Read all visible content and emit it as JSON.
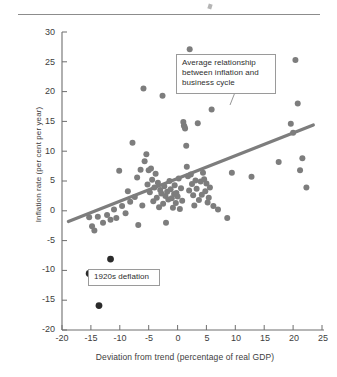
{
  "figure": {
    "y_axis_title": "Inflation rate (per cent per year)",
    "x_axis_title": "Deviation from trend (percentage of real GDP)",
    "annotations": {
      "trend": "Average relationship between inflation and business cycle",
      "deflation": "1920s deflation"
    }
  },
  "chart_data": {
    "type": "scatter",
    "title": "",
    "xlabel": "Deviation from trend (percentage of real GDP)",
    "ylabel": "Inflation rate (per cent per year)",
    "xlim": [
      -20,
      25
    ],
    "ylim": [
      -20,
      30
    ],
    "xticks": [
      -20,
      -15,
      -10,
      -5,
      0,
      5,
      10,
      15,
      20,
      25
    ],
    "yticks": [
      -20,
      -15,
      -10,
      -5,
      0,
      5,
      10,
      15,
      20,
      25,
      30
    ],
    "grid": false,
    "legend": "none",
    "point_color": "#7d7d7d",
    "highlight_color": "#2b2b2b",
    "trendline_color": "#7d7d7d",
    "series": [
      {
        "name": "Inflation vs business cycle",
        "color": "#7d7d7d",
        "points": [
          [
            -15.3,
            -1.1
          ],
          [
            -14.8,
            -2.6
          ],
          [
            -14.4,
            -3.3
          ],
          [
            -13.8,
            -1.0
          ],
          [
            -12.9,
            -2.0
          ],
          [
            -12.2,
            -0.7
          ],
          [
            -11.6,
            -1.5
          ],
          [
            -11.0,
            0.2
          ],
          [
            -10.6,
            -1.2
          ],
          [
            -10.1,
            6.7
          ],
          [
            -9.6,
            0.8
          ],
          [
            -9.0,
            -0.4
          ],
          [
            -8.6,
            3.3
          ],
          [
            -8.2,
            1.5
          ],
          [
            -7.8,
            11.4
          ],
          [
            -7.4,
            2.3
          ],
          [
            -7.0,
            5.6
          ],
          [
            -6.8,
            -2.4
          ],
          [
            -6.4,
            6.9
          ],
          [
            -6.1,
            0.9
          ],
          [
            -5.9,
            20.5
          ],
          [
            -5.7,
            8.3
          ],
          [
            -5.4,
            9.5
          ],
          [
            -5.2,
            4.4
          ],
          [
            -5.0,
            6.8
          ],
          [
            -4.8,
            3.1
          ],
          [
            -4.6,
            7.1
          ],
          [
            -4.4,
            5.2
          ],
          [
            -4.2,
            1.6
          ],
          [
            -4.0,
            3.9
          ],
          [
            -3.8,
            6.2
          ],
          [
            -3.6,
            2.2
          ],
          [
            -3.4,
            4.7
          ],
          [
            -3.2,
            0.6
          ],
          [
            -3.0,
            3.5
          ],
          [
            -2.8,
            2.9
          ],
          [
            -2.6,
            19.3
          ],
          [
            -2.5,
            1.2
          ],
          [
            -2.3,
            4.1
          ],
          [
            -2.1,
            2.5
          ],
          [
            -2.0,
            -2.0
          ],
          [
            -1.8,
            3.2
          ],
          [
            -1.6,
            1.9
          ],
          [
            -1.4,
            5.0
          ],
          [
            -1.2,
            3.6
          ],
          [
            -1.0,
            2.1
          ],
          [
            -0.8,
            0.5
          ],
          [
            -0.6,
            2.8
          ],
          [
            -0.5,
            4.3
          ],
          [
            -0.3,
            1.3
          ],
          [
            -0.2,
            3.0
          ],
          [
            0.0,
            2.4
          ],
          [
            0.2,
            5.4
          ],
          [
            0.4,
            0.3
          ],
          [
            0.6,
            3.8
          ],
          [
            0.8,
            1.7
          ],
          [
            1.0,
            14.9
          ],
          [
            1.1,
            14.3
          ],
          [
            1.2,
            14.1
          ],
          [
            1.3,
            13.8
          ],
          [
            1.5,
            10.9
          ],
          [
            1.6,
            7.4
          ],
          [
            1.8,
            5.8
          ],
          [
            2.0,
            3.4
          ],
          [
            2.1,
            27.1
          ],
          [
            2.3,
            6.1
          ],
          [
            2.5,
            4.5
          ],
          [
            2.7,
            2.6
          ],
          [
            2.9,
            0.9
          ],
          [
            3.1,
            5.1
          ],
          [
            3.3,
            3.7
          ],
          [
            3.5,
            14.7
          ],
          [
            3.7,
            1.8
          ],
          [
            4.0,
            4.9
          ],
          [
            4.2,
            2.7
          ],
          [
            4.4,
            6.4
          ],
          [
            4.6,
            5.3
          ],
          [
            4.8,
            3.3
          ],
          [
            5.0,
            4.6
          ],
          [
            5.2,
            1.4
          ],
          [
            5.4,
            2.2
          ],
          [
            5.6,
            3.9
          ],
          [
            5.9,
            17.0
          ],
          [
            6.2,
            0.8
          ],
          [
            7.0,
            0.2
          ],
          [
            8.6,
            -1.2
          ],
          [
            9.4,
            6.4
          ],
          [
            12.8,
            5.7
          ],
          [
            17.5,
            8.2
          ],
          [
            19.6,
            14.6
          ],
          [
            20.0,
            13.1
          ],
          [
            20.4,
            25.3
          ],
          [
            20.8,
            18.0
          ],
          [
            21.2,
            6.8
          ],
          [
            21.6,
            8.8
          ],
          [
            22.3,
            3.9
          ]
        ]
      },
      {
        "name": "1920s deflation",
        "color": "#2b2b2b",
        "points": [
          [
            -15.3,
            -10.5
          ],
          [
            -11.6,
            -8.1
          ],
          [
            -13.6,
            -15.9
          ]
        ]
      }
    ],
    "trendline": {
      "label": "Average relationship between inflation and business cycle",
      "x": [
        -18.9,
        23.5
      ],
      "y": [
        -1.8,
        14.4
      ],
      "color": "#7d7d7d"
    },
    "annotations": [
      {
        "text": "Average relationship between inflation and business cycle",
        "target": "trendline"
      },
      {
        "text": "1920s deflation",
        "target": "1920s deflation points"
      }
    ]
  },
  "yticks": [
    {
      "label": "30",
      "top": 27
    },
    {
      "label": "25",
      "top": 57
    },
    {
      "label": "20",
      "top": 86
    },
    {
      "label": "15",
      "top": 116
    },
    {
      "label": "10",
      "top": 146
    },
    {
      "label": "5",
      "top": 175
    },
    {
      "label": "0",
      "top": 205
    },
    {
      "label": "-5",
      "top": 235
    },
    {
      "label": "-10",
      "top": 264
    },
    {
      "label": "-15",
      "top": 294
    },
    {
      "label": "-20",
      "top": 324
    }
  ],
  "xticks": [
    {
      "label": "-20",
      "left": 49
    },
    {
      "label": "-15",
      "left": 78
    },
    {
      "label": "-10",
      "left": 107
    },
    {
      "label": "-5",
      "left": 136
    },
    {
      "label": "0",
      "left": 165
    },
    {
      "label": "5",
      "left": 194
    },
    {
      "label": "10",
      "left": 223
    },
    {
      "label": "15",
      "left": 252
    },
    {
      "label": "20",
      "left": 281
    },
    {
      "label": "25",
      "left": 310
    }
  ]
}
